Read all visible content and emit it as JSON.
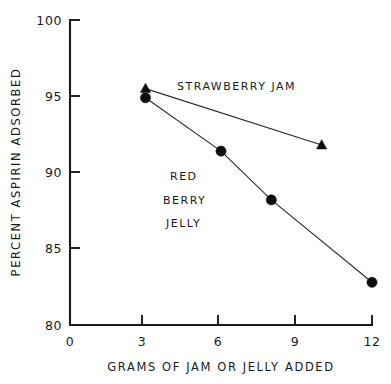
{
  "chart_data": {
    "type": "line",
    "title": "",
    "xlabel": "GRAMS OF JAM OR JELLY ADDED",
    "ylabel": "PERCENT ASPIRIN ADSORBED",
    "xlim": [
      0,
      12
    ],
    "ylim": [
      80,
      100
    ],
    "xticks": [
      0,
      3,
      6,
      9,
      12
    ],
    "xtick_labels": [
      "0",
      "3",
      "6",
      "9",
      "12"
    ],
    "yticks": [
      80,
      85,
      90,
      95,
      100
    ],
    "ytick_labels": [
      "80",
      "85",
      "90",
      "95",
      "100"
    ],
    "grid": false,
    "legend_position": "inline-annotation",
    "series": [
      {
        "name": "STRAWBERRY JAM",
        "marker": "triangle",
        "color": "#0d0d0d",
        "x": [
          3,
          10
        ],
        "values": [
          95.5,
          91.8
        ]
      },
      {
        "name": "RED BERRY JELLY",
        "marker": "circle",
        "color": "#0d0d0d",
        "x": [
          3,
          6,
          8,
          12
        ],
        "values": [
          94.9,
          91.4,
          88.2,
          82.8
        ]
      }
    ],
    "annotations": [
      {
        "id": "strawberry-jam-label",
        "text": "STRAWBERRY JAM",
        "x": 6.6,
        "y": 95.9
      },
      {
        "id": "red-berry-jelly-label-line1",
        "text": "RED",
        "x": 5.55,
        "y": 89.8
      },
      {
        "id": "red-berry-jelly-label-line2",
        "text": "BERRY",
        "x": 5.85,
        "y": 88.2
      },
      {
        "id": "red-berry-jelly-label-line3",
        "text": "JELLY",
        "x": 5.8,
        "y": 86.7
      }
    ]
  },
  "axes": {
    "x_title": "GRAMS OF JAM OR JELLY ADDED",
    "y_title": "PERCENT ASPIRIN ADSORBED",
    "x_tick_0": "0",
    "x_tick_1": "3",
    "x_tick_2": "6",
    "x_tick_3": "9",
    "x_tick_4": "12",
    "y_tick_0": "80",
    "y_tick_1": "85",
    "y_tick_2": "90",
    "y_tick_3": "95",
    "y_tick_4": "100"
  },
  "labels": {
    "strawberry_jam": "STRAWBERRY JAM",
    "red": "RED",
    "berry": "BERRY",
    "jelly": "JELLY"
  }
}
